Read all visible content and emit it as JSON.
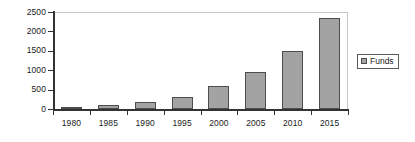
{
  "chart_data": {
    "type": "bar",
    "title": "",
    "subtitle": "",
    "xlabel": "",
    "ylabel": "",
    "categories": [
      "1980",
      "1985",
      "1990",
      "1995",
      "2000",
      "2005",
      "2010",
      "2015"
    ],
    "series": [
      {
        "name": "Funds",
        "values": [
          50,
          110,
          190,
          310,
          600,
          950,
          1500,
          2350
        ]
      }
    ],
    "ylim": [
      0,
      2500
    ],
    "y_ticks": [
      0,
      500,
      1000,
      1500,
      2000,
      2500
    ],
    "y_tick_labels": [
      "0",
      "500",
      "1000",
      "1500",
      "2000",
      "2500"
    ],
    "x_tick_labels": [
      "1980",
      "1985",
      "1990",
      "1995",
      "2000",
      "2005",
      "2010",
      "2015"
    ],
    "grid": false,
    "legend": {
      "position": "right",
      "entries": [
        {
          "label": "Funds",
          "color": "#a3a3a3"
        }
      ]
    },
    "colors": {
      "bar_fill": "#a3a3a3",
      "bar_border": "#4d4d4d",
      "axis": "#333333",
      "frame": "#c8c8c8",
      "text": "#1a1a1a"
    }
  }
}
